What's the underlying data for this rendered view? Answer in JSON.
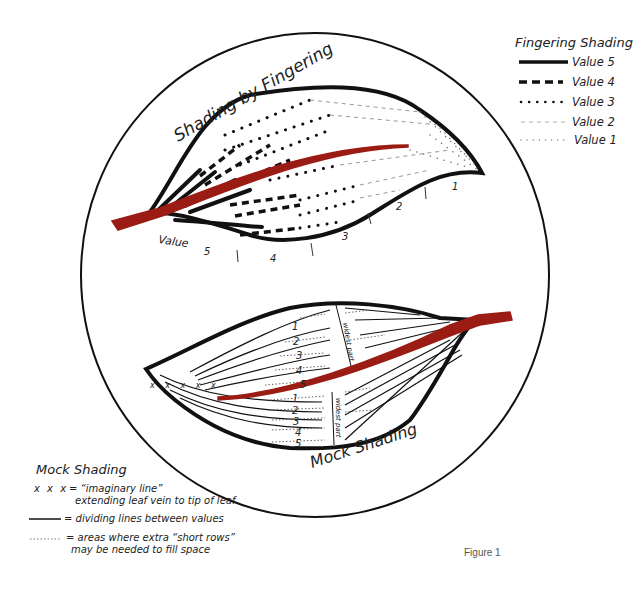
{
  "colors": {
    "ink": "#111111",
    "vein": "#9b1c14",
    "faint": "#888888"
  },
  "legend_fingering": {
    "title": "Fingering Shading",
    "items": [
      {
        "label": "Value 5",
        "style": "solid-thick"
      },
      {
        "label": "Value 4",
        "style": "dashed-thick"
      },
      {
        "label": "Value 3",
        "style": "dotted-bold"
      },
      {
        "label": "Value 2",
        "style": "dashed-faint"
      },
      {
        "label": "Value 1",
        "style": "dotted-faint"
      }
    ]
  },
  "leaf_top": {
    "title": "Shading by Fingering",
    "value_label": "Value",
    "value_markers": [
      "5",
      "4",
      "3",
      "2",
      "1"
    ]
  },
  "leaf_bottom": {
    "title": "Mock Shading",
    "upper_values": [
      "1",
      "2",
      "3",
      "4",
      "5"
    ],
    "lower_values": [
      "1",
      "2",
      "3",
      "4",
      "5"
    ],
    "widest_label": "widest part",
    "imaginary_marks": "x x x x x"
  },
  "legend_mock": {
    "title": "Mock Shading",
    "items": [
      {
        "symbol": "x x x",
        "text": "= “imaginary line”",
        "text2": "extending leaf vein to tip of leaf"
      },
      {
        "symbol": "solid-line",
        "text": "= dividing lines between values"
      },
      {
        "symbol": "dotted-line",
        "text": "= areas where extra “short rows”",
        "text2": "may be needed to fill space"
      }
    ]
  },
  "figure_label": "Figure 1"
}
